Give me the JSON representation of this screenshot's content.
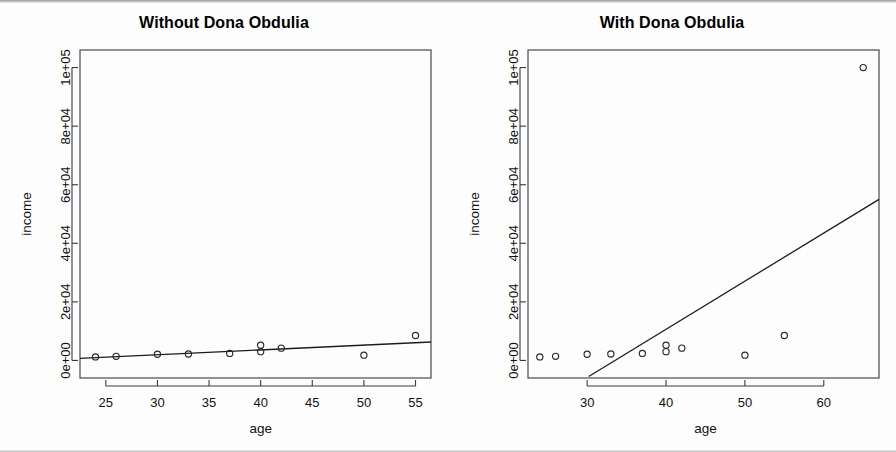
{
  "figure": {
    "background_color": "#fdfdfd",
    "foreground_color": "#000000",
    "panel_count": 2
  },
  "chart_data": [
    {
      "type": "scatter",
      "panel_index": 0,
      "title": "Without Dona Obdulia",
      "xlabel": "age",
      "ylabel": "income",
      "xlim": [
        22.5,
        56.5
      ],
      "ylim": [
        -6000,
        106000
      ],
      "xticks": [
        25,
        30,
        35,
        40,
        45,
        50,
        55
      ],
      "xticklabels": [
        "25",
        "30",
        "35",
        "40",
        "45",
        "50",
        "55"
      ],
      "yticks": [
        0,
        20000,
        40000,
        60000,
        80000,
        100000
      ],
      "yticklabels": [
        "0e+00",
        "2e+04",
        "4e+04",
        "6e+04",
        "8e+04",
        "1e+05"
      ],
      "grid": false,
      "legend": false,
      "marker": "open-circle",
      "x": [
        24,
        26,
        30,
        33,
        37,
        40,
        40,
        42,
        50,
        55
      ],
      "y": [
        1200,
        1400,
        2100,
        2200,
        2400,
        3000,
        5200,
        4200,
        1800,
        8500
      ],
      "points": [
        {
          "age": 24,
          "income": 1200
        },
        {
          "age": 26,
          "income": 1400
        },
        {
          "age": 30,
          "income": 2100
        },
        {
          "age": 33,
          "income": 2200
        },
        {
          "age": 37,
          "income": 2400
        },
        {
          "age": 40,
          "income": 3000
        },
        {
          "age": 40,
          "income": 5200
        },
        {
          "age": 42,
          "income": 4200
        },
        {
          "age": 50,
          "income": 1800
        },
        {
          "age": 55,
          "income": 8500
        }
      ],
      "regression_line": {
        "x_start": 22.5,
        "y_start": 700,
        "x_end": 56.5,
        "y_end": 6300,
        "slope": 165,
        "intercept": -3000
      }
    },
    {
      "type": "scatter",
      "panel_index": 1,
      "title": "With Dona Obdulia",
      "xlabel": "age",
      "ylabel": "income",
      "xlim": [
        22.5,
        67.0
      ],
      "ylim": [
        -6000,
        106000
      ],
      "xticks": [
        30,
        40,
        50,
        60
      ],
      "xticklabels": [
        "30",
        "40",
        "50",
        "60"
      ],
      "yticks": [
        0,
        20000,
        40000,
        60000,
        80000,
        100000
      ],
      "yticklabels": [
        "0e+00",
        "2e+04",
        "4e+04",
        "6e+04",
        "8e+04",
        "1e+05"
      ],
      "grid": false,
      "legend": false,
      "marker": "open-circle",
      "x": [
        24,
        26,
        30,
        33,
        37,
        40,
        40,
        42,
        50,
        55,
        65
      ],
      "y": [
        1200,
        1400,
        2100,
        2200,
        2400,
        3000,
        5200,
        4200,
        1800,
        8500,
        100000
      ],
      "points": [
        {
          "age": 24,
          "income": 1200
        },
        {
          "age": 26,
          "income": 1400
        },
        {
          "age": 30,
          "income": 2100
        },
        {
          "age": 33,
          "income": 2200
        },
        {
          "age": 37,
          "income": 2400
        },
        {
          "age": 40,
          "income": 3000
        },
        {
          "age": 40,
          "income": 5200
        },
        {
          "age": 42,
          "income": 4200
        },
        {
          "age": 50,
          "income": 1800
        },
        {
          "age": 55,
          "income": 8500
        },
        {
          "age": 65,
          "income": 100000
        }
      ],
      "regression_line": {
        "x_start": 30.2,
        "y_start": -5500,
        "x_end": 67.0,
        "y_end": 55000,
        "slope": 1645,
        "intercept": -55200
      },
      "outlier": {
        "age": 65,
        "income": 100000,
        "label": "Dona Obdulia"
      }
    }
  ]
}
